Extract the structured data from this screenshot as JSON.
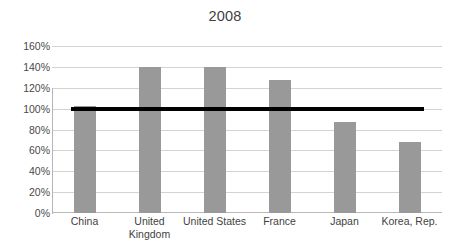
{
  "chart_data": {
    "type": "bar",
    "title": "2008",
    "xlabel": "",
    "ylabel": "",
    "categories": [
      "China",
      "United Kingdom",
      "United States",
      "France",
      "Japan",
      "Korea, Rep."
    ],
    "category_lines": [
      [
        "China"
      ],
      [
        "United",
        "Kingdom"
      ],
      [
        "United States"
      ],
      [
        "France"
      ],
      [
        "Japan"
      ],
      [
        "Korea, Rep."
      ]
    ],
    "values": [
      103,
      140,
      140,
      127,
      87,
      68
    ],
    "value_labels": [
      "103%",
      "140%",
      "140%",
      "127%",
      "87%",
      "68%"
    ],
    "ylim": [
      0,
      160
    ],
    "ytick_values": [
      0,
      20,
      40,
      60,
      80,
      100,
      120,
      140,
      160
    ],
    "ytick_labels": [
      "0%",
      "20%",
      "40%",
      "60%",
      "80%",
      "100%",
      "120%",
      "140%",
      "160%"
    ],
    "grid": true,
    "legend": "none",
    "bar_color": "#999999",
    "gridline_color": "#d3d3d3",
    "reference_line": {
      "name": "100% reference line",
      "value": 100,
      "label": "100%",
      "color": "#000000",
      "thickness_px": 4,
      "orientation": "horizontal"
    }
  }
}
